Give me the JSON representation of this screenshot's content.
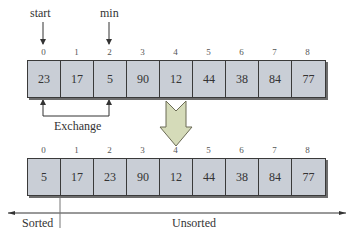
{
  "pointers": {
    "start": "start",
    "min": "min"
  },
  "before": {
    "indices": [
      "0",
      "1",
      "2",
      "3",
      "4",
      "5",
      "6",
      "7",
      "8"
    ],
    "values": [
      "23",
      "17",
      "5",
      "90",
      "12",
      "44",
      "38",
      "84",
      "77"
    ]
  },
  "exchange_label": "Exchange",
  "after": {
    "indices": [
      "0",
      "1",
      "2",
      "3",
      "4",
      "5",
      "6",
      "7",
      "8"
    ],
    "values": [
      "5",
      "17",
      "23",
      "90",
      "12",
      "44",
      "38",
      "84",
      "77"
    ]
  },
  "partition": {
    "sorted": "Sorted",
    "unsorted": "Unsorted"
  },
  "colors": {
    "cell_fill": "#c9ced6",
    "arrow_fill": "#d5dbb9",
    "line": "#3a3a3a"
  }
}
